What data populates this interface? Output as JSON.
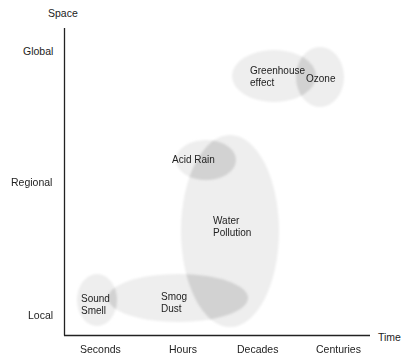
{
  "diagram": {
    "type": "scale-diagram",
    "y_axis": {
      "title": "Space",
      "ticks": [
        "Global",
        "Regional",
        "Local"
      ]
    },
    "x_axis": {
      "title": "Time",
      "ticks": [
        "Seconds",
        "Hours",
        "Decades",
        "Centuries"
      ]
    },
    "phenomena": [
      {
        "id": "greenhouse",
        "label": "Greenhouse\neffect",
        "space": "Global",
        "time": "Decades"
      },
      {
        "id": "ozone",
        "label": "Ozone",
        "space": "Global",
        "time": "Centuries"
      },
      {
        "id": "acid-rain",
        "label": "Acid Rain",
        "space": "Regional",
        "time": "Hours–Decades"
      },
      {
        "id": "water-pollution",
        "label": "Water\nPollution",
        "space": "Local–Regional",
        "time": "Decades"
      },
      {
        "id": "smog-dust",
        "label": "Smog\nDust",
        "space": "Local",
        "time": "Hours"
      },
      {
        "id": "sound-smell",
        "label": "Sound\nSmell",
        "space": "Local",
        "time": "Seconds"
      }
    ],
    "colors": {
      "blob_fill": "#eeeeee",
      "overlap_fill": "#d4d4d4",
      "axis": "#222222"
    }
  }
}
